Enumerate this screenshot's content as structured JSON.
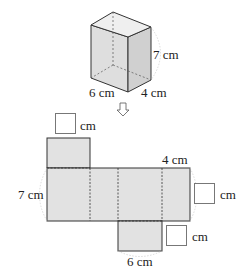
{
  "prism": {
    "height_label": "7 cm",
    "width_label": "6 cm",
    "depth_label": "4 cm"
  },
  "arrow": {
    "icon": "down-arrow-icon"
  },
  "net": {
    "left_height_label": "7 cm",
    "top_right_label": "4 cm",
    "bottom_label": "6 cm",
    "answer_boxes": [
      {
        "position": "top",
        "unit": "cm",
        "value": ""
      },
      {
        "position": "right",
        "unit": "cm",
        "value": ""
      },
      {
        "position": "bottom-right",
        "unit": "cm",
        "value": ""
      }
    ]
  },
  "colors": {
    "face_fill": "#e3e3e3",
    "side_fill": "#d6d6d6",
    "stroke": "#333333",
    "guide": "#cccccc"
  }
}
